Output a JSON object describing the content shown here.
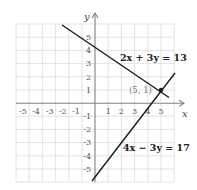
{
  "diagram": {
    "type": "coordinate-graph",
    "axes": {
      "x_label": "x",
      "y_label": "y",
      "x_ticks": [
        "-5",
        "-4",
        "-3",
        "-2",
        "-1",
        "1",
        "2",
        "3",
        "4",
        "5"
      ],
      "y_ticks": [
        "5",
        "4",
        "3",
        "2",
        "1",
        "-1",
        "-2",
        "-3",
        "-4",
        "-5"
      ],
      "x_range": [
        -6,
        6
      ],
      "y_range": [
        -6,
        6
      ]
    },
    "lines": [
      {
        "equation": "2x + 3y = 13",
        "color": "#1a1a1a"
      },
      {
        "equation": "4x − 3y = 17",
        "color": "#1a1a1a"
      }
    ],
    "intersection": {
      "label": "(5, 1)",
      "x": 5,
      "y": 1
    },
    "grid_color": "#d9d9d9",
    "axis_color": "#777777"
  }
}
